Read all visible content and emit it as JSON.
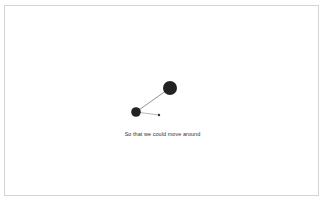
{
  "diagram": {
    "caption": "So that we could move around",
    "colors": {
      "node": "#222222",
      "edge": "#777777",
      "border": "#d4d4d4",
      "background": "#ffffff"
    },
    "nodes": [
      {
        "id": "large",
        "cx": 170,
        "cy": 88,
        "r": 7
      },
      {
        "id": "medium",
        "cx": 136,
        "cy": 112,
        "r": 4.8
      },
      {
        "id": "tiny",
        "cx": 159,
        "cy": 115,
        "r": 1.2
      }
    ],
    "edges": [
      {
        "from": "medium",
        "to": "large"
      },
      {
        "from": "medium",
        "to": "tiny"
      }
    ]
  }
}
